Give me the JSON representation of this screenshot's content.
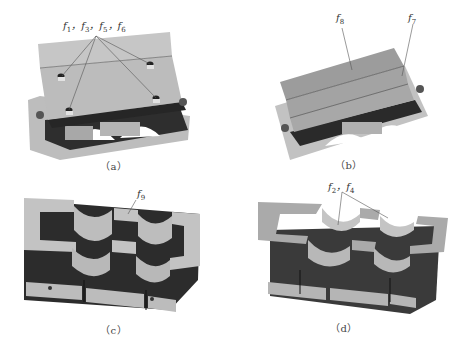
{
  "figure": {
    "panels": [
      {
        "id": "a",
        "caption": "（a）",
        "annotation": "f1, f3, f5, f6",
        "annotation_parts": [
          {
            "sym": "f",
            "sub": "1"
          },
          {
            "sym": "f",
            "sub": "3"
          },
          {
            "sym": "f",
            "sub": "5"
          },
          {
            "sym": "f",
            "sub": "6"
          }
        ],
        "description": "Assembled block, top view with four bolt holes"
      },
      {
        "id": "b",
        "caption": "（b）",
        "annotations": [
          {
            "sym": "f",
            "sub": "8"
          },
          {
            "sym": "f",
            "sub": "7"
          }
        ],
        "description": "Assembled block, top cover plates"
      },
      {
        "id": "c",
        "caption": "（c）",
        "annotations": [
          {
            "sym": "f",
            "sub": "9"
          }
        ],
        "description": "Lower half with two semicircular bores"
      },
      {
        "id": "d",
        "caption": "（d）",
        "annotation_parts": [
          {
            "sym": "f",
            "sub": "2"
          },
          {
            "sym": "f",
            "sub": "4"
          }
        ],
        "description": "Lower half, alternate view, bore faces"
      }
    ],
    "separator": "，",
    "colors": {
      "light_face": "#c8c8c8",
      "mid_face": "#9a9a9a",
      "dark_face": "#3a3a3a",
      "darkest": "#1e1e1e",
      "leader_line": "#555555",
      "caption_text": "#444444"
    }
  }
}
